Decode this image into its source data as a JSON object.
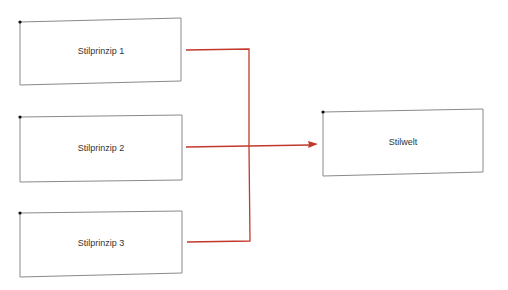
{
  "diagram": {
    "type": "flow",
    "colors": {
      "box_stroke": "#8a8a8a",
      "connector": "#c0392b",
      "anchor_dot": "#111111",
      "text": "#333333"
    },
    "nodes": [
      {
        "id": "p1",
        "label": "Stilprinzip 1"
      },
      {
        "id": "p2",
        "label": "Stilprinzip 2"
      },
      {
        "id": "p3",
        "label": "Stilprinzip 3"
      },
      {
        "id": "world",
        "label": "Stilwelt"
      }
    ],
    "edges": [
      {
        "from": "p1",
        "to": "world"
      },
      {
        "from": "p2",
        "to": "world"
      },
      {
        "from": "p3",
        "to": "world"
      }
    ]
  }
}
